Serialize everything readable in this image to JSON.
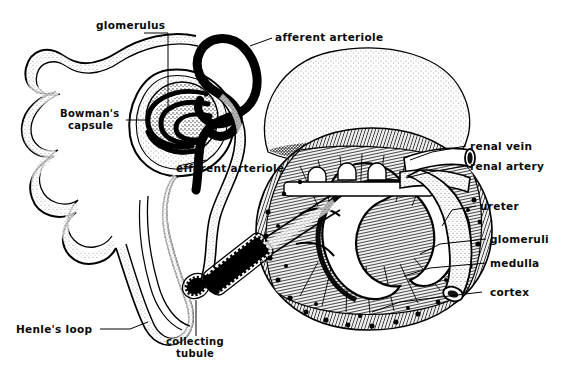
{
  "figure": {
    "type": "anatomical-line-drawing",
    "width": 564,
    "height": 379,
    "background_color": "#ffffff",
    "ink_color": "#000000",
    "style": "pen-and-ink stipple engraving with handwritten labels"
  },
  "labels": {
    "glomerulus": "glomerulus",
    "afferent_arteriole": "afferent arteriole",
    "bowmans_capsule_line1": "Bowman's",
    "bowmans_capsule_line2": "capsule",
    "efferent_arteriole": "efferent arteriole",
    "renal_vein": "renal vein",
    "renal_artery": "renal artery",
    "ureter": "ureter",
    "glomeruli": "glomeruli",
    "medulla": "medulla",
    "cortex": "cortex",
    "henles_loop": "Henle's loop",
    "collecting_tubule_line1": "collecting",
    "collecting_tubule_line2": "tubule"
  },
  "structures": [
    {
      "name": "adrenal-gland",
      "note": "stippled cap above kidney"
    },
    {
      "name": "kidney-cortex",
      "note": "outer granular zone with dark glomeruli dots"
    },
    {
      "name": "kidney-medulla",
      "note": "striated renal pyramids"
    },
    {
      "name": "renal-pelvis",
      "note": "white branching calyces funnelling to ureter"
    },
    {
      "name": "nephron-tubule",
      "note": "convoluted tubule coils at left"
    },
    {
      "name": "loop-of-henle",
      "note": "long descending and ascending limb"
    },
    {
      "name": "collecting-tubule",
      "note": "cut tubule showing cell lining"
    }
  ]
}
